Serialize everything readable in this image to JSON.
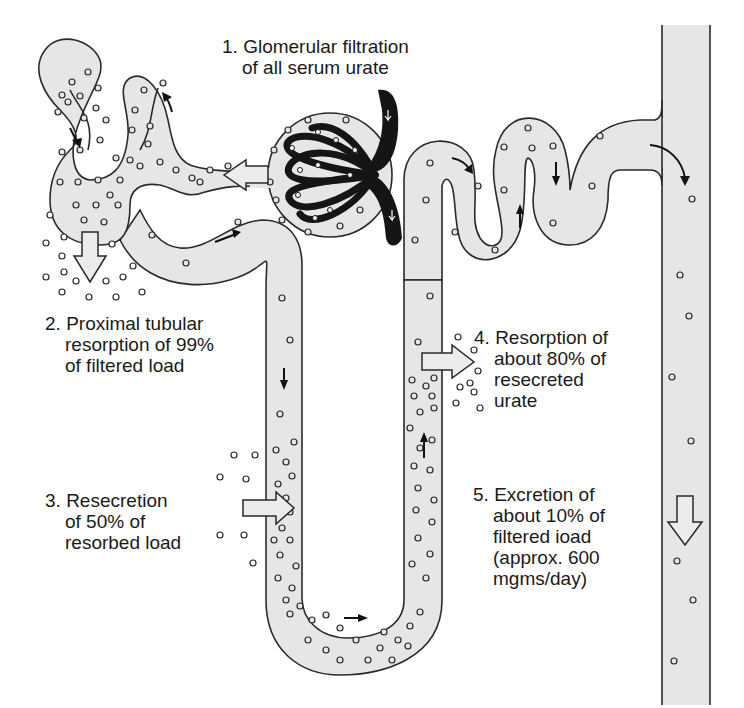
{
  "diagram": {
    "colors": {
      "tubule_fill": "#e6e6e6",
      "outline": "#2a2a2a",
      "glomerulus": "#151515",
      "background": "#ffffff"
    },
    "labels": [
      {
        "id": "step1",
        "number": "1.",
        "lines": [
          "Glomerular filtration",
          "of all serum urate"
        ]
      },
      {
        "id": "step2",
        "number": "2.",
        "lines": [
          "Proximal tubular",
          "resorption of 99%",
          "of filtered load"
        ]
      },
      {
        "id": "step3",
        "number": "3.",
        "lines": [
          "Resecretion",
          "of 50% of",
          "resorbed load"
        ]
      },
      {
        "id": "step4",
        "number": "4.",
        "lines": [
          "Resorption of",
          "about 80% of",
          "resecreted",
          "urate"
        ]
      },
      {
        "id": "step5",
        "number": "5.",
        "lines": [
          "Excretion of",
          "about 10% of",
          "filtered ioad",
          "(approx. 600",
          "mgms/day)"
        ]
      }
    ],
    "structures": [
      {
        "name": "glomerulus",
        "icon": "capillary-tuft"
      },
      {
        "name": "bowmans-capsule"
      },
      {
        "name": "proximal-convoluted-tubule"
      },
      {
        "name": "loop-of-henle"
      },
      {
        "name": "distal-convoluted-tubule"
      },
      {
        "name": "collecting-duct"
      }
    ],
    "arrows": [
      {
        "name": "filtration-arrow",
        "direction": "left"
      },
      {
        "name": "proximal-resorption-arrow",
        "direction": "down"
      },
      {
        "name": "resecretion-arrow",
        "direction": "right"
      },
      {
        "name": "distal-resorption-arrow",
        "direction": "right"
      },
      {
        "name": "excretion-arrow",
        "direction": "down"
      }
    ]
  }
}
